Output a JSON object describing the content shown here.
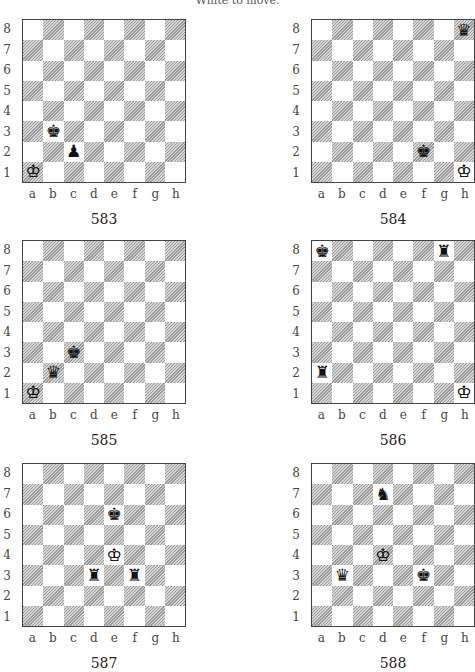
{
  "header": "White to move.",
  "files": [
    "a",
    "b",
    "c",
    "d",
    "e",
    "f",
    "g",
    "h"
  ],
  "ranks": [
    "8",
    "7",
    "6",
    "5",
    "4",
    "3",
    "2",
    "1"
  ],
  "diagrams": [
    {
      "number": "583",
      "x": 0,
      "y": 19,
      "pieces": [
        {
          "sq": "b3",
          "color": "b",
          "type": "king"
        },
        {
          "sq": "c2",
          "color": "b",
          "type": "pawn"
        },
        {
          "sq": "a1",
          "color": "w",
          "type": "king"
        }
      ]
    },
    {
      "number": "584",
      "x": 289,
      "y": 19,
      "pieces": [
        {
          "sq": "h8",
          "color": "b",
          "type": "queen"
        },
        {
          "sq": "f2",
          "color": "b",
          "type": "king"
        },
        {
          "sq": "h1",
          "color": "w",
          "type": "king"
        }
      ]
    },
    {
      "number": "585",
      "x": 0,
      "y": 240,
      "pieces": [
        {
          "sq": "c3",
          "color": "b",
          "type": "king"
        },
        {
          "sq": "b2",
          "color": "b",
          "type": "queen"
        },
        {
          "sq": "a1",
          "color": "w",
          "type": "king"
        }
      ]
    },
    {
      "number": "586",
      "x": 289,
      "y": 240,
      "pieces": [
        {
          "sq": "a8",
          "color": "b",
          "type": "king"
        },
        {
          "sq": "g8",
          "color": "b",
          "type": "rook"
        },
        {
          "sq": "a2",
          "color": "b",
          "type": "rook"
        },
        {
          "sq": "h1",
          "color": "w",
          "type": "king"
        }
      ]
    },
    {
      "number": "587",
      "x": 0,
      "y": 463,
      "pieces": [
        {
          "sq": "e6",
          "color": "b",
          "type": "king"
        },
        {
          "sq": "e4",
          "color": "w",
          "type": "king"
        },
        {
          "sq": "d3",
          "color": "b",
          "type": "rook"
        },
        {
          "sq": "f3",
          "color": "b",
          "type": "rook"
        }
      ]
    },
    {
      "number": "588",
      "x": 289,
      "y": 463,
      "pieces": [
        {
          "sq": "d7",
          "color": "b",
          "type": "knight"
        },
        {
          "sq": "d4",
          "color": "w",
          "type": "king"
        },
        {
          "sq": "b3",
          "color": "b",
          "type": "queen"
        },
        {
          "sq": "f3",
          "color": "b",
          "type": "king"
        }
      ]
    }
  ]
}
